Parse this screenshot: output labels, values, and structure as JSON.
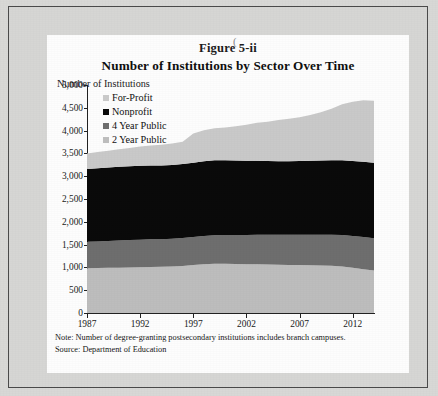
{
  "figure": {
    "label": "Figure 5-ii",
    "title": "Number of Institutions by Sector Over Time",
    "axis_title": "Number of Institutions",
    "note": "Note: Number of degree-granting postsecondary institutions includes branch campuses.",
    "source": "Source: Department of Education"
  },
  "colors": {
    "for_profit": "#c9c9c9",
    "nonprofit": "#0a0a0a",
    "four_year_public": "#6e6e6e",
    "two_year_public": "#bdbdbd",
    "axis": "#222222",
    "paper": "#fdfdfd",
    "frame": "#d6d6d4"
  },
  "chart_data": {
    "type": "area",
    "stacked": true,
    "title": "Number of Institutions by Sector Over Time",
    "xlabel": "",
    "ylabel": "Number of Institutions",
    "ylim": [
      0,
      5000
    ],
    "ytick_labels": [
      "5,000",
      "4,500",
      "4,000",
      "3,500",
      "3,000",
      "2,500",
      "2,000",
      "1,500",
      "1,000",
      "500",
      "0"
    ],
    "ytick_values": [
      5000,
      4500,
      4000,
      3500,
      3000,
      2500,
      2000,
      1500,
      1000,
      500,
      0
    ],
    "xlim": [
      1987,
      2014
    ],
    "xtick_labels": [
      "1987",
      "1992",
      "1997",
      "2002",
      "2007",
      "2012"
    ],
    "xtick_values": [
      1987,
      1992,
      1997,
      2002,
      2007,
      2012
    ],
    "grid": false,
    "legend_position": "upper-left",
    "x": [
      1987,
      1988,
      1989,
      1990,
      1991,
      1992,
      1993,
      1994,
      1995,
      1996,
      1997,
      1998,
      1999,
      2000,
      2001,
      2002,
      2003,
      2004,
      2005,
      2006,
      2007,
      2008,
      2009,
      2010,
      2011,
      2012,
      2013,
      2014
    ],
    "series": [
      {
        "name": "2 Year Public",
        "stack_order": 1,
        "color": "#bdbdbd",
        "values": [
          980,
          985,
          990,
          995,
          1000,
          1005,
          1010,
          1015,
          1020,
          1030,
          1050,
          1070,
          1080,
          1080,
          1075,
          1070,
          1070,
          1065,
          1060,
          1055,
          1050,
          1045,
          1040,
          1035,
          1020,
          990,
          960,
          930
        ]
      },
      {
        "name": "4 Year Public",
        "stack_order": 2,
        "color": "#6e6e6e",
        "values": [
          580,
          585,
          590,
          595,
          600,
          600,
          605,
          605,
          610,
          615,
          615,
          620,
          625,
          630,
          635,
          640,
          645,
          650,
          655,
          660,
          665,
          670,
          675,
          680,
          690,
          700,
          705,
          710
        ]
      },
      {
        "name": "Nonprofit",
        "stack_order": 3,
        "color": "#0a0a0a",
        "values": [
          1600,
          1605,
          1610,
          1615,
          1620,
          1625,
          1620,
          1615,
          1615,
          1620,
          1630,
          1640,
          1645,
          1640,
          1635,
          1630,
          1625,
          1620,
          1615,
          1615,
          1620,
          1625,
          1630,
          1635,
          1640,
          1645,
          1650,
          1655
        ]
      },
      {
        "name": "For-Profit",
        "stack_order": 4,
        "color": "#c9c9c9",
        "values": [
          340,
          355,
          370,
          385,
          400,
          420,
          440,
          455,
          470,
          490,
          640,
          680,
          700,
          720,
          750,
          790,
          830,
          860,
          900,
          930,
          960,
          1000,
          1060,
          1130,
          1230,
          1300,
          1350,
          1360
        ]
      }
    ],
    "totals": [
      3500,
      3530,
      3560,
      3590,
      3620,
      3650,
      3675,
      3690,
      3715,
      3755,
      3935,
      4010,
      4050,
      4070,
      4095,
      4130,
      4170,
      4195,
      4230,
      4260,
      4295,
      4340,
      4405,
      4480,
      4580,
      4635,
      4665,
      4655
    ]
  }
}
